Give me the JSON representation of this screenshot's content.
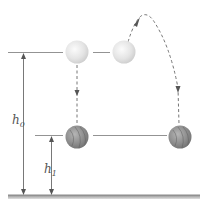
{
  "diagram": {
    "title": "",
    "labels": {
      "h0": {
        "main": "h",
        "sub": "0"
      },
      "h1": {
        "main": "h",
        "sub": "1"
      }
    },
    "elements": {
      "ball_initial": "released ball at initial height h0",
      "ball_thrown": "ball thrown upward from height h0",
      "ball_final_left": "ball at final height h1 (dropped)",
      "ball_final_right": "ball at final height h1 (thrown)",
      "ground": "ground"
    },
    "colors": {
      "light_ball": "#e6e6e6",
      "dark_ball": "#8a8a8a",
      "line": "#666666",
      "ground": "#9a9a9a"
    }
  }
}
